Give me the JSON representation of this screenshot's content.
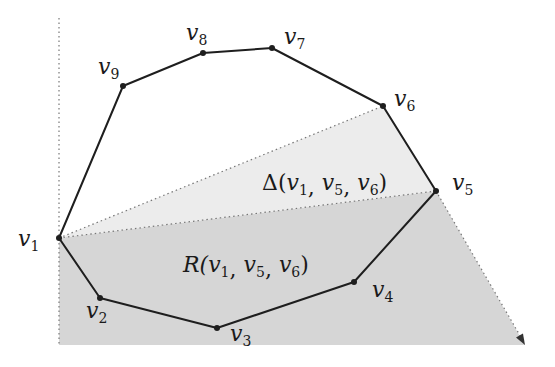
{
  "diagram": {
    "title": "",
    "colors": {
      "background": "#ffffff",
      "region_R_fill": "#d6d6d6",
      "triangle_fill": "#ececec",
      "polygon_stroke": "#1e1e1e",
      "dotted_stroke": "#777777",
      "vertex_fill": "#1e1e1e"
    },
    "vertices": [
      {
        "id": "v1",
        "name": "v",
        "sub": "1",
        "x": 59,
        "y": 238,
        "label_x": 18,
        "label_y": 246
      },
      {
        "id": "v2",
        "name": "v",
        "sub": "2",
        "x": 100,
        "y": 298,
        "label_x": 86,
        "label_y": 318
      },
      {
        "id": "v3",
        "name": "v",
        "sub": "3",
        "x": 217,
        "y": 328,
        "label_x": 230,
        "label_y": 341
      },
      {
        "id": "v4",
        "name": "v",
        "sub": "4",
        "x": 354,
        "y": 282,
        "label_x": 372,
        "label_y": 297
      },
      {
        "id": "v5",
        "name": "v",
        "sub": "5",
        "x": 436,
        "y": 191,
        "label_x": 452,
        "label_y": 190
      },
      {
        "id": "v6",
        "name": "v",
        "sub": "6",
        "x": 383,
        "y": 106,
        "label_x": 394,
        "label_y": 106
      },
      {
        "id": "v7",
        "name": "v",
        "sub": "7",
        "x": 272,
        "y": 48,
        "label_x": 284,
        "label_y": 44
      },
      {
        "id": "v8",
        "name": "v",
        "sub": "8",
        "x": 203,
        "y": 53,
        "label_x": 186,
        "label_y": 40
      },
      {
        "id": "v9",
        "name": "v",
        "sub": "9",
        "x": 123,
        "y": 86,
        "label_x": 98,
        "label_y": 74
      }
    ],
    "regions": {
      "triangle": {
        "label_prefix": "Δ(",
        "label_args": [
          {
            "name": "v",
            "sub": "1"
          },
          {
            "name": "v",
            "sub": "5"
          },
          {
            "name": "v",
            "sub": "6"
          }
        ],
        "label_suffix": ")",
        "label_x": 262,
        "label_y": 190
      },
      "R": {
        "label_prefix": "R(",
        "label_args": [
          {
            "name": "v",
            "sub": "1"
          },
          {
            "name": "v",
            "sub": "5"
          },
          {
            "name": "v",
            "sub": "6"
          }
        ],
        "label_suffix": ")",
        "label_x": 183,
        "label_y": 272
      }
    },
    "text": {
      "triangle_label": "Δ(v1, v5, v6)",
      "region_label": "R(v1, v5, v6)",
      "comma": ", "
    },
    "dotted_vertical": {
      "x": 59,
      "y_top": 18,
      "y_bottom": 345
    },
    "region_bottom_y": 345,
    "ray_end": {
      "x": 525,
      "y": 345
    }
  }
}
